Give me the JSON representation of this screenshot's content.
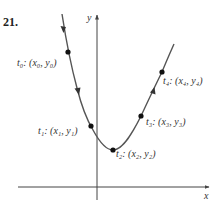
{
  "problem_number": "21.",
  "axes": {
    "x_label": "x",
    "y_label": "y",
    "origin_px": [
      97,
      187
    ],
    "x_axis_range_px": [
      18,
      210
    ],
    "y_axis_range_px": [
      200,
      14
    ]
  },
  "curve": {
    "description": "Parametric curve decreasing then increasing, traced from upper-left to upper-right",
    "color": "#555555",
    "points": [
      {
        "id": "t0",
        "label": "t₀: (x₀, y₀)",
        "px": [
          68,
          52
        ]
      },
      {
        "id": "t1",
        "label": "t₁: (x₁, y₁)",
        "px": [
          91,
          126
        ]
      },
      {
        "id": "t2",
        "label": "t₂: (x₂, y₂)",
        "px": [
          113,
          150
        ]
      },
      {
        "id": "t3",
        "label": "t₃: (x₃, y₃)",
        "px": [
          141,
          116
        ]
      },
      {
        "id": "t4",
        "label": "t₄: (x₄, y₄)",
        "px": [
          162,
          72
        ]
      }
    ],
    "direction_arrows": [
      {
        "px": [
          63,
          30
        ],
        "direction": "down"
      },
      {
        "px": [
          78,
          92
        ],
        "direction": "down"
      },
      {
        "px": [
          153,
          91
        ],
        "direction": "up"
      }
    ]
  }
}
